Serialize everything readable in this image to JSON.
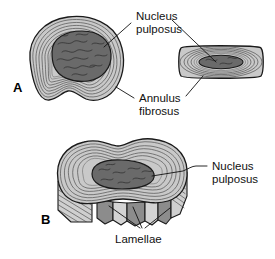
{
  "figure": {
    "background_color": "#ffffff",
    "panels": [
      {
        "id": "A",
        "label": "A",
        "description": "Transverse (top) view of intervertebral disc with inset lateral view"
      },
      {
        "id": "B",
        "label": "B",
        "description": "Three-dimensional cutaway view of intervertebral disc"
      }
    ]
  },
  "labels": {
    "nucleus_pulposus_top": {
      "line1": "Nucleus",
      "line2": "pulposus"
    },
    "annulus_fibrosus": {
      "line1": "Annulus",
      "line2": "fibrosus"
    },
    "nucleus_pulposus_bottom": {
      "line1": "Nucleus",
      "line2": "pulposus"
    },
    "lamellae": {
      "line1": "Lamellae"
    },
    "panel_a": "A",
    "panel_b": "B"
  },
  "colors": {
    "background": "#ffffff",
    "annulus_light": "#c9c9c9",
    "annulus_mid": "#b5b5b5",
    "annulus_pale": "#dcdcdc",
    "nucleus_dark": "#6a6a6a",
    "nucleus_darker": "#5e5e5e",
    "cut_face_light": "#cfcfcf",
    "cut_face_dark": "#8c8c8c",
    "outline": "#1a1a1a",
    "text": "#111111",
    "ring_line": "#585858"
  }
}
